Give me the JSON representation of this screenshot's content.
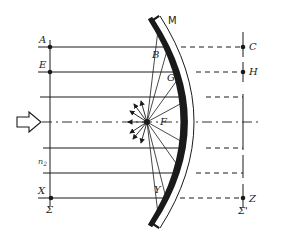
{
  "diagram": {
    "type": "optics-ray-diagram",
    "mirror_label": "M",
    "focus_label": "F",
    "left_points": {
      "a": "A",
      "e": "E",
      "x": "X"
    },
    "right_points": {
      "c": "C",
      "h": "H",
      "z": "Z"
    },
    "mirror_points": {
      "b": "B",
      "g": "G",
      "y": "Y"
    },
    "left_plane_label": "Σ",
    "right_plane_label": "Σ'",
    "medium_label": "n",
    "medium_sub": "2",
    "colors": {
      "ink": "#1a1a1a",
      "background": "#ffffff"
    }
  }
}
